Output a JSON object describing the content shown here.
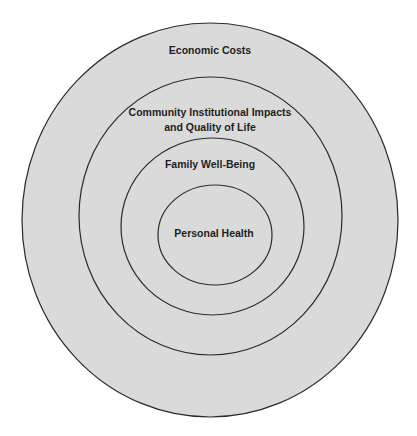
{
  "diagram": {
    "type": "concentric-ellipses",
    "fill_color": "#dadada",
    "stroke_color": "#2b2b2b",
    "rings": [
      {
        "level": 1,
        "label": "Economic Costs"
      },
      {
        "level": 2,
        "label_line1": "Community Institutional Impacts",
        "label_line2": "and Quality of Life"
      },
      {
        "level": 3,
        "label": "Family Well-Being"
      },
      {
        "level": 4,
        "label": "Personal Health"
      }
    ]
  }
}
